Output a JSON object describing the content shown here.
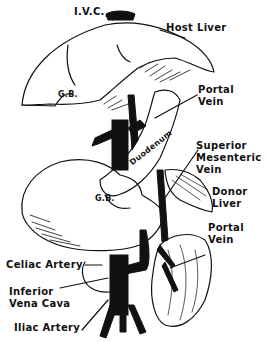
{
  "figure": {
    "labels": {
      "ivc": "I.V.C.",
      "host_liver": "Host Liver",
      "gb_host": "G.B.",
      "portal_vein_top_1": "Portal",
      "portal_vein_top_2": "Vein",
      "duodenum": "Duodenum",
      "sup_mes_1": "Superior",
      "sup_mes_2": "Mesenteric",
      "sup_mes_3": "Vein",
      "donor_liver_1": "Donor",
      "donor_liver_2": "Liver",
      "gb_donor": "G.B.",
      "portal_vein_bot_1": "Portal",
      "portal_vein_bot_2": "Vein",
      "celiac_artery": "Celiac Artery",
      "inferior_vc_1": "Inferior",
      "inferior_vc_2": "Vena Cava",
      "iliac_artery": "Iliac Artery"
    },
    "colors": {
      "ink": "#111111",
      "paper": "#ffffff"
    }
  }
}
